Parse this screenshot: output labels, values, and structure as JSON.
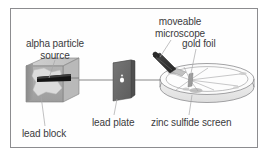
{
  "diagram": {
    "border_color": "#8c8c8f",
    "background_color": "#fefefe",
    "text_color": "#3b3b3d",
    "beam_color": "#6e6e70"
  },
  "labels": {
    "alpha_particle_source_line1": "alpha particle",
    "alpha_particle_source_line2": "source",
    "moveable_line1": "moveable",
    "moveable_line2": "microscope",
    "gold_foil": "gold foil",
    "lead_block": "lead block",
    "lead_plate": "lead plate",
    "zinc_sulfide_screen": "zinc sulfide screen"
  },
  "parts": {
    "lead_block": {
      "name": "lead block",
      "top_face_color": "#c9c9c9",
      "left_face_color": "#8d8d8d",
      "front_face_color": "#a8a8a8",
      "cavity_color": "#d9d9d9",
      "source_slot_color": "#1a1a1a"
    },
    "lead_plate": {
      "name": "lead plate",
      "face_color": "#6b6b6b",
      "edge_color": "#4a4a4a",
      "aperture_color": "#ffffff"
    },
    "microscope": {
      "name": "moveable microscope",
      "body_color": "#3a3a3a",
      "mount_color": "#bdbdbd"
    },
    "detector_ring": {
      "name": "zinc sulfide screen",
      "ring_stroke": "#8a8a8c",
      "band_fill": "#efefef",
      "inner_fill": "#fbfbfb",
      "flash_color": "#b5b5b5"
    },
    "gold_foil": {
      "name": "gold foil",
      "color": "#9a9a9a"
    }
  }
}
